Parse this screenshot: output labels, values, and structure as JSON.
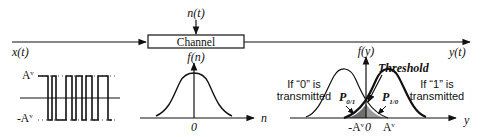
{
  "system": {
    "input_label": "x(t)",
    "noise_label": "n(t)",
    "channel_label": "Channel",
    "output_label": "y(t)"
  },
  "binary_signal": {
    "high_label": "A",
    "high_sup": "v",
    "low_label": "-A",
    "low_sup": "v"
  },
  "noise_pdf": {
    "y_label": "f(n)",
    "x_label": "n",
    "origin_label": "0"
  },
  "received_pdf": {
    "y_label": "f(y)",
    "x_label": "y",
    "threshold_label": "Threshold",
    "origin_label": "0",
    "neg_mean_label": "-A",
    "pos_mean_label": "A",
    "mean_sup": "v",
    "zero_case_line1": "If “0” is",
    "zero_case_line2": "transmitted",
    "one_case_line1": "If “1” is",
    "one_case_line2": "transmitted",
    "p01_label": "P",
    "p01_sub": "0/1",
    "p10_label": "P",
    "p10_sub": "1/0"
  },
  "colors": {
    "stroke": "#111111",
    "shaded_region": "#555555"
  }
}
